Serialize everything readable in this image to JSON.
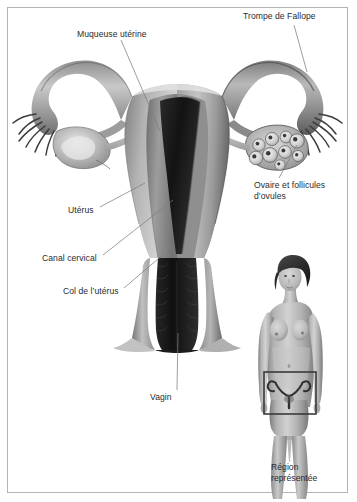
{
  "figure": {
    "background_color": "#ffffff",
    "border_color": "#b3b3b3",
    "label_color": "#2b2b2b",
    "leader_line_color": "#808080"
  },
  "labels": {
    "muqueuse_uterine": "Muqueuse utérine",
    "trompe_de_fallope": "Trompe de Fallope",
    "ovaire_follicules": "Ovaire et follicules\nd’ovules",
    "uterus": "Utérus",
    "canal_cervical": "Canal cervical",
    "col_de_luterus": "Col de l’utérus",
    "vagin": "Vagin",
    "region_representee": "Région\nreprésentée"
  },
  "anatomy_parts": [
    {
      "name": "uterus-body",
      "label": "Utérus"
    },
    {
      "name": "endometrium",
      "label": "Muqueuse utérine"
    },
    {
      "name": "fallopian-tube-left",
      "label": "Trompe de Fallope"
    },
    {
      "name": "fallopian-tube-right",
      "label": "Trompe de Fallope"
    },
    {
      "name": "ovary-left",
      "label": "Ovaire"
    },
    {
      "name": "ovary-right",
      "label": "Ovaire et follicules d’ovules"
    },
    {
      "name": "fimbriae-left",
      "label": "Franges"
    },
    {
      "name": "fimbriae-right",
      "label": "Franges"
    },
    {
      "name": "cervical-canal",
      "label": "Canal cervical"
    },
    {
      "name": "cervix",
      "label": "Col de l’utérus"
    },
    {
      "name": "vagina",
      "label": "Vagin"
    }
  ],
  "inset": {
    "figure_description": "Femme debout, vue de face",
    "highlight_box_label": "Région représentée",
    "follicle_count": 9
  }
}
